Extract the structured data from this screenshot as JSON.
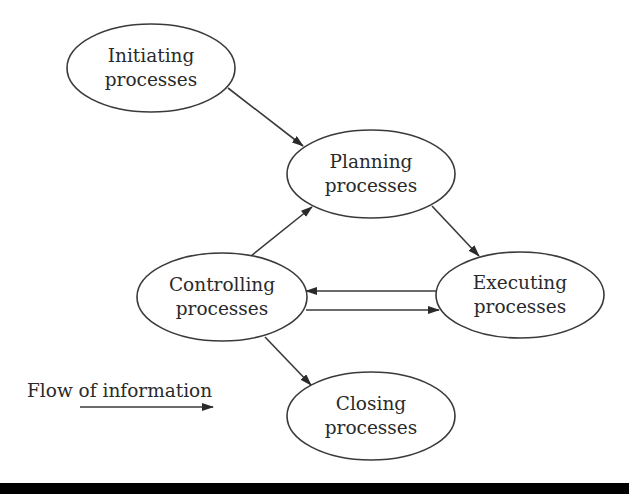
{
  "diagram": {
    "nodes": [
      {
        "id": "initiating",
        "line1": "Initiating",
        "line2": "processes"
      },
      {
        "id": "planning",
        "line1": "Planning",
        "line2": "processes"
      },
      {
        "id": "controlling",
        "line1": "Controlling",
        "line2": "processes"
      },
      {
        "id": "executing",
        "line1": "Executing",
        "line2": "processes"
      },
      {
        "id": "closing",
        "line1": "Closing",
        "line2": "processes"
      }
    ],
    "edges": [
      {
        "from": "initiating",
        "to": "planning"
      },
      {
        "from": "controlling",
        "to": "planning"
      },
      {
        "from": "planning",
        "to": "executing"
      },
      {
        "from": "executing",
        "to": "controlling"
      },
      {
        "from": "controlling",
        "to": "executing"
      },
      {
        "from": "controlling",
        "to": "closing"
      }
    ],
    "legend": {
      "label": "Flow of information",
      "icon": "right-arrow"
    },
    "colors": {
      "stroke": "#3a3a3a",
      "text": "#2a2a2a",
      "background": "#ffffff",
      "bottom_bar": "#000000"
    }
  }
}
